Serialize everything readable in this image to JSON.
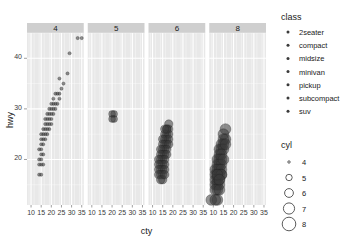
{
  "chart_data": {
    "type": "scatter",
    "title": "",
    "xlabel": "cty",
    "ylabel": "hwy",
    "xlim": [
      8,
      36
    ],
    "ylim": [
      11,
      45
    ],
    "xticks": [
      10,
      15,
      20,
      25,
      30,
      35
    ],
    "yticks": [
      20,
      30,
      40
    ],
    "grid": true,
    "facet_var": "cyl",
    "facets": [
      "4",
      "5",
      "6",
      "8"
    ],
    "size_var": "cyl",
    "color_var": "class",
    "point_color": "#3a3a3a",
    "panel_bg": "#e8e8e8",
    "strip_bg": "#cfcfcf",
    "grid_color": "#ffffff",
    "series": [
      {
        "name": "4",
        "facet": "4",
        "size": 4,
        "points": [
          [
            33,
            44
          ],
          [
            35,
            44
          ],
          [
            29,
            41
          ],
          [
            28,
            37
          ],
          [
            24,
            36
          ],
          [
            26,
            35
          ],
          [
            25,
            34
          ],
          [
            24,
            33
          ],
          [
            23,
            33
          ],
          [
            22,
            33
          ],
          [
            24,
            32
          ],
          [
            21,
            32
          ],
          [
            23,
            31
          ],
          [
            22,
            31
          ],
          [
            21,
            31
          ],
          [
            20,
            31
          ],
          [
            22,
            30
          ],
          [
            21,
            30
          ],
          [
            20,
            30
          ],
          [
            19,
            30
          ],
          [
            21,
            29
          ],
          [
            20,
            29
          ],
          [
            19,
            29
          ],
          [
            18,
            29
          ],
          [
            20,
            28
          ],
          [
            19,
            28
          ],
          [
            18,
            28
          ],
          [
            17,
            28
          ],
          [
            20,
            27
          ],
          [
            19,
            27
          ],
          [
            18,
            27
          ],
          [
            17,
            27
          ],
          [
            19,
            26
          ],
          [
            18,
            26
          ],
          [
            17,
            26
          ],
          [
            16,
            26
          ],
          [
            18,
            25
          ],
          [
            17,
            25
          ],
          [
            16,
            25
          ],
          [
            15,
            25
          ],
          [
            17,
            24
          ],
          [
            16,
            24
          ],
          [
            15,
            24
          ],
          [
            16,
            23
          ],
          [
            15,
            23
          ],
          [
            15,
            22
          ],
          [
            14,
            22
          ],
          [
            16,
            21
          ],
          [
            15,
            21
          ],
          [
            14,
            20
          ],
          [
            15,
            20
          ],
          [
            14,
            19
          ],
          [
            15,
            19
          ],
          [
            16,
            19
          ],
          [
            14,
            17
          ],
          [
            15,
            17
          ]
        ]
      },
      {
        "name": "5",
        "facet": "5",
        "size": 5,
        "points": [
          [
            21,
            29
          ],
          [
            20,
            29
          ],
          [
            21,
            28
          ],
          [
            20,
            28
          ]
        ]
      },
      {
        "name": "6",
        "facet": "6",
        "size": 6,
        "points": [
          [
            18,
            27
          ],
          [
            18,
            26
          ],
          [
            17,
            26
          ],
          [
            17,
            25
          ],
          [
            18,
            25
          ],
          [
            16,
            25
          ],
          [
            17,
            24
          ],
          [
            16,
            24
          ],
          [
            18,
            24
          ],
          [
            15,
            24
          ],
          [
            16,
            23
          ],
          [
            17,
            23
          ],
          [
            15,
            23
          ],
          [
            18,
            23
          ],
          [
            16,
            22
          ],
          [
            15,
            22
          ],
          [
            17,
            22
          ],
          [
            14,
            22
          ],
          [
            15,
            21
          ],
          [
            16,
            21
          ],
          [
            14,
            21
          ],
          [
            17,
            21
          ],
          [
            15,
            20
          ],
          [
            14,
            20
          ],
          [
            16,
            20
          ],
          [
            13,
            20
          ],
          [
            14,
            19
          ],
          [
            15,
            19
          ],
          [
            16,
            19
          ],
          [
            13,
            19
          ],
          [
            14,
            18
          ],
          [
            15,
            18
          ],
          [
            13,
            18
          ],
          [
            16,
            18
          ],
          [
            14,
            17
          ],
          [
            15,
            17
          ],
          [
            13,
            17
          ],
          [
            15,
            16
          ],
          [
            14,
            16
          ],
          [
            16,
            17
          ],
          [
            17,
            26
          ],
          [
            16,
            26
          ]
        ]
      },
      {
        "name": "8",
        "facet": "8",
        "size": 8,
        "points": [
          [
            16,
            26
          ],
          [
            15,
            25
          ],
          [
            16,
            24
          ],
          [
            15,
            24
          ],
          [
            14,
            23
          ],
          [
            15,
            23
          ],
          [
            13,
            22
          ],
          [
            14,
            22
          ],
          [
            15,
            22
          ],
          [
            13,
            21
          ],
          [
            14,
            21
          ],
          [
            12,
            20
          ],
          [
            13,
            20
          ],
          [
            14,
            20
          ],
          [
            12,
            19
          ],
          [
            13,
            19
          ],
          [
            14,
            19
          ],
          [
            11,
            18
          ],
          [
            12,
            18
          ],
          [
            13,
            18
          ],
          [
            14,
            18
          ],
          [
            11,
            17
          ],
          [
            12,
            17
          ],
          [
            13,
            17
          ],
          [
            14,
            17
          ],
          [
            11,
            16
          ],
          [
            12,
            16
          ],
          [
            13,
            16
          ],
          [
            11,
            15
          ],
          [
            12,
            15
          ],
          [
            13,
            15
          ],
          [
            12,
            14
          ],
          [
            11,
            14
          ],
          [
            13,
            14
          ],
          [
            12,
            12
          ],
          [
            14,
            17
          ],
          [
            15,
            20
          ],
          [
            16,
            23
          ],
          [
            9,
            12
          ],
          [
            11,
            12
          ],
          [
            12,
            17
          ],
          [
            13,
            16
          ]
        ]
      }
    ]
  },
  "axes": {
    "x_title": "cty",
    "y_title": "hwy",
    "x_tick_labels": [
      "10",
      "15",
      "20",
      "25",
      "30",
      "35"
    ],
    "y_tick_labels": [
      "40",
      "30",
      "20"
    ]
  },
  "strips": [
    {
      "label": "4"
    },
    {
      "label": "5"
    },
    {
      "label": "6"
    },
    {
      "label": "8"
    }
  ],
  "legends": {
    "class": {
      "title": "class",
      "items": [
        {
          "label": "2seater"
        },
        {
          "label": "compact"
        },
        {
          "label": "midsize"
        },
        {
          "label": "minivan"
        },
        {
          "label": "pickup"
        },
        {
          "label": "subcompact"
        },
        {
          "label": "suv"
        }
      ]
    },
    "cyl": {
      "title": "cyl",
      "items": [
        {
          "label": "4",
          "radius": 1.2
        },
        {
          "label": "5",
          "radius": 3.2
        },
        {
          "label": "6",
          "radius": 4.4
        },
        {
          "label": "7",
          "radius": 5.6
        },
        {
          "label": "8",
          "radius": 6.8
        }
      ]
    }
  }
}
